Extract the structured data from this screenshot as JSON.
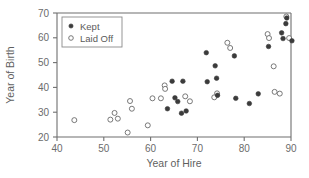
{
  "chart_data": {
    "type": "scatter",
    "title": "",
    "xlabel": "Year of Hire",
    "ylabel": "Year of Birth",
    "xlim": [
      40,
      90
    ],
    "ylim": [
      20,
      70
    ],
    "xticks": [
      40,
      50,
      60,
      70,
      80,
      90
    ],
    "yticks": [
      20,
      30,
      40,
      50,
      60,
      70
    ],
    "grid": false,
    "legend_position": "top-left",
    "legend": [
      "Kept",
      "Laid Off"
    ],
    "series": [
      {
        "name": "Kept",
        "marker": "filled-circle",
        "color": "#3b3b3b",
        "points": [
          [
            63.6,
            31.4
          ],
          [
            64.6,
            42.5
          ],
          [
            65.2,
            35.8
          ],
          [
            65.8,
            34.3
          ],
          [
            66.6,
            29.6
          ],
          [
            66.9,
            42.5
          ],
          [
            67.6,
            30.5
          ],
          [
            71.9,
            54.0
          ],
          [
            72.1,
            42.3
          ],
          [
            73.8,
            48.7
          ],
          [
            74.1,
            43.7
          ],
          [
            74.3,
            36.8
          ],
          [
            77.9,
            52.7
          ],
          [
            78.2,
            35.6
          ],
          [
            81.1,
            33.5
          ],
          [
            83.0,
            37.4
          ],
          [
            85.2,
            56.5
          ],
          [
            88.0,
            62.0
          ],
          [
            88.3,
            59.7
          ],
          [
            88.9,
            65.7
          ],
          [
            89.1,
            68.0
          ],
          [
            90.2,
            58.8
          ]
        ]
      },
      {
        "name": "Laid Off",
        "marker": "open-circle",
        "color": "#6a6a6a",
        "points": [
          [
            43.7,
            26.8
          ],
          [
            51.4,
            27.0
          ],
          [
            52.3,
            29.7
          ],
          [
            53.0,
            27.4
          ],
          [
            55.1,
            21.8
          ],
          [
            55.6,
            34.5
          ],
          [
            56.0,
            31.4
          ],
          [
            59.4,
            24.7
          ],
          [
            60.4,
            35.6
          ],
          [
            62.2,
            35.6
          ],
          [
            63.0,
            40.8
          ],
          [
            63.1,
            39.4
          ],
          [
            67.4,
            36.4
          ],
          [
            68.4,
            34.4
          ],
          [
            73.6,
            36.0
          ],
          [
            74.2,
            37.6
          ],
          [
            76.4,
            58.0
          ],
          [
            77.0,
            55.9
          ],
          [
            85.0,
            61.5
          ],
          [
            85.3,
            59.9
          ],
          [
            86.3,
            48.5
          ],
          [
            86.5,
            38.2
          ],
          [
            87.6,
            37.5
          ],
          [
            89.0,
            68.6
          ],
          [
            89.6,
            59.9
          ]
        ]
      }
    ]
  }
}
